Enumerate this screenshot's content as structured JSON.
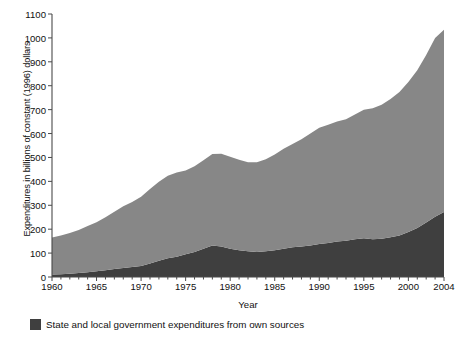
{
  "chart_data": {
    "type": "area",
    "title": "",
    "subtitle": "",
    "xlabel": "Year",
    "ylabel": "Expenditures in billions of constant (1996) dollars",
    "xlim": [
      1960,
      2004
    ],
    "ylim": [
      0,
      1100
    ],
    "ytick_step": 100,
    "grid": false,
    "stacked": true,
    "legend_position": "bottom-left",
    "yticks": [
      0,
      100,
      200,
      300,
      400,
      500,
      600,
      700,
      800,
      900,
      1000,
      1100
    ],
    "ytick_labels": [
      "0",
      "100",
      "200",
      "300",
      "400",
      "500",
      "600",
      "700",
      "800",
      "900",
      "1000",
      "1100"
    ],
    "xticks": [
      1960,
      1965,
      1970,
      1975,
      1980,
      1985,
      1990,
      1995,
      2000,
      2004
    ],
    "xtick_labels": [
      "1960",
      "1965",
      "1970",
      "1975",
      "1980",
      "1985",
      "1990",
      "1995",
      "2000",
      "2004"
    ],
    "x": [
      1960,
      1961,
      1962,
      1963,
      1964,
      1965,
      1966,
      1967,
      1968,
      1969,
      1970,
      1971,
      1972,
      1973,
      1974,
      1975,
      1976,
      1977,
      1978,
      1979,
      1980,
      1981,
      1982,
      1983,
      1984,
      1985,
      1986,
      1987,
      1988,
      1989,
      1990,
      1991,
      1992,
      1993,
      1994,
      1995,
      1996,
      1997,
      1998,
      1999,
      2000,
      2001,
      2002,
      2003,
      2004
    ],
    "series": [
      {
        "name": "Federal and other expenditures",
        "color": "#878787",
        "stack_order": 2,
        "values": [
          155,
          162,
          170,
          180,
          193,
          205,
          222,
          240,
          258,
          272,
          290,
          312,
          330,
          345,
          352,
          350,
          358,
          370,
          382,
          388,
          385,
          378,
          372,
          375,
          385,
          400,
          418,
          432,
          448,
          468,
          486,
          495,
          502,
          508,
          522,
          538,
          548,
          560,
          578,
          600,
          628,
          660,
          700,
          748,
          762
        ]
      },
      {
        "name": "State and local government expenditures from own sources",
        "color": "#3f3f3f",
        "stack_order": 1,
        "values": [
          10,
          12,
          14,
          17,
          20,
          24,
          28,
          33,
          38,
          42,
          46,
          56,
          68,
          78,
          85,
          95,
          105,
          118,
          132,
          128,
          118,
          112,
          108,
          105,
          108,
          112,
          118,
          124,
          128,
          132,
          138,
          142,
          148,
          152,
          158,
          162,
          158,
          160,
          166,
          174,
          188,
          205,
          228,
          252,
          272
        ]
      }
    ],
    "totals": [
      165,
      174,
      184,
      197,
      213,
      229,
      250,
      273,
      296,
      314,
      336,
      368,
      398,
      423,
      437,
      445,
      463,
      488,
      514,
      516,
      503,
      490,
      480,
      480,
      493,
      512,
      536,
      556,
      576,
      600,
      624,
      637,
      650,
      660,
      680,
      700,
      706,
      720,
      744,
      774,
      816,
      865,
      928,
      1000,
      1034
    ]
  },
  "legend": {
    "entries": [
      {
        "label": "State and local government expenditures from own sources",
        "color": "#3f3f3f"
      }
    ]
  }
}
